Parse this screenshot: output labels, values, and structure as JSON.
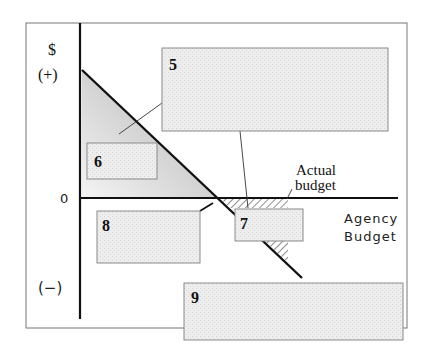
{
  "diagram": {
    "y_axis": {
      "symbol": "$",
      "positive_label": "(+)",
      "zero_label": "0",
      "negative_label": "(−)"
    },
    "x_axis": {
      "label_line1": "Agency",
      "label_line2": "Budget"
    },
    "annotation": {
      "line1": "Actual",
      "line2": "budget"
    },
    "boxes": [
      {
        "id": "5",
        "label": "5"
      },
      {
        "id": "6",
        "label": "6"
      },
      {
        "id": "7",
        "label": "7"
      },
      {
        "id": "8",
        "label": "8"
      },
      {
        "id": "9",
        "label": "9"
      }
    ],
    "colors": {
      "line": "#111111",
      "frame": "#777777",
      "box_fill": "#ececec",
      "box_stroke": "#8a8a8a",
      "gradient_dark": "#2a2a2a",
      "gradient_light": "#f2f2f2"
    }
  }
}
